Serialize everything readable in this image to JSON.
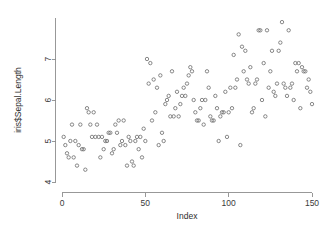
{
  "chart_data": {
    "type": "scatter",
    "title": "",
    "xlabel": "Index",
    "ylabel": "iris$Sepal.Length",
    "xlim": [
      0,
      150
    ],
    "ylim": [
      4.0,
      8.0
    ],
    "xticks": [
      "0",
      "50",
      "100",
      "150"
    ],
    "xtick_values": [
      0,
      50,
      100,
      150
    ],
    "yticks": [
      "4",
      "5",
      "6",
      "7"
    ],
    "ytick_values": [
      4,
      5,
      6,
      7
    ],
    "grid": false,
    "legend": "none",
    "marker": "open-circle",
    "marker_color": "#6b6b6b",
    "series": [
      {
        "name": "iris$Sepal.Length",
        "x": [
          1,
          2,
          3,
          4,
          5,
          6,
          7,
          8,
          9,
          10,
          11,
          12,
          13,
          14,
          15,
          16,
          17,
          18,
          19,
          20,
          21,
          22,
          23,
          24,
          25,
          26,
          27,
          28,
          29,
          30,
          31,
          32,
          33,
          34,
          35,
          36,
          37,
          38,
          39,
          40,
          41,
          42,
          43,
          44,
          45,
          46,
          47,
          48,
          49,
          50,
          51,
          52,
          53,
          54,
          55,
          56,
          57,
          58,
          59,
          60,
          61,
          62,
          63,
          64,
          65,
          66,
          67,
          68,
          69,
          70,
          71,
          72,
          73,
          74,
          75,
          76,
          77,
          78,
          79,
          80,
          81,
          82,
          83,
          84,
          85,
          86,
          87,
          88,
          89,
          90,
          91,
          92,
          93,
          94,
          95,
          96,
          97,
          98,
          99,
          100,
          101,
          102,
          103,
          104,
          105,
          106,
          107,
          108,
          109,
          110,
          111,
          112,
          113,
          114,
          115,
          116,
          117,
          118,
          119,
          120,
          121,
          122,
          123,
          124,
          125,
          126,
          127,
          128,
          129,
          130,
          131,
          132,
          133,
          134,
          135,
          136,
          137,
          138,
          139,
          140,
          141,
          142,
          143,
          144,
          145,
          146,
          147,
          148,
          149,
          150
        ],
        "values": [
          5.1,
          4.9,
          4.7,
          4.6,
          5.0,
          5.4,
          4.6,
          5.0,
          4.4,
          4.9,
          5.4,
          4.8,
          4.8,
          4.3,
          5.8,
          5.7,
          5.4,
          5.1,
          5.7,
          5.1,
          5.4,
          5.1,
          4.6,
          5.1,
          4.8,
          5.0,
          5.0,
          5.2,
          5.2,
          4.7,
          4.8,
          5.4,
          5.2,
          5.5,
          4.9,
          5.0,
          5.5,
          4.9,
          4.4,
          5.1,
          5.0,
          4.5,
          4.4,
          5.0,
          5.1,
          4.8,
          5.1,
          4.6,
          5.3,
          5.0,
          7.0,
          6.4,
          6.9,
          5.5,
          6.5,
          5.7,
          6.3,
          4.9,
          6.6,
          5.2,
          5.0,
          5.9,
          6.0,
          6.1,
          5.6,
          6.7,
          5.6,
          5.8,
          6.2,
          5.6,
          5.9,
          6.1,
          6.3,
          6.1,
          6.4,
          6.6,
          6.8,
          6.7,
          6.0,
          5.7,
          5.5,
          5.5,
          5.8,
          6.0,
          5.4,
          6.0,
          6.7,
          6.3,
          5.6,
          5.5,
          5.5,
          6.1,
          5.8,
          5.0,
          5.6,
          5.7,
          5.7,
          6.2,
          5.1,
          5.7,
          6.3,
          5.8,
          7.1,
          6.3,
          6.5,
          7.6,
          4.9,
          7.3,
          6.7,
          7.2,
          6.5,
          6.4,
          6.8,
          5.7,
          5.8,
          6.4,
          6.5,
          7.7,
          7.7,
          6.0,
          6.9,
          5.6,
          7.7,
          6.3,
          6.7,
          7.2,
          6.2,
          6.1,
          6.4,
          7.2,
          7.4,
          7.9,
          6.4,
          6.3,
          6.1,
          7.7,
          6.3,
          6.4,
          6.0,
          6.9,
          6.7,
          6.9,
          5.8,
          6.8,
          6.7,
          6.7,
          6.3,
          6.5,
          6.2,
          5.9
        ]
      }
    ]
  },
  "plot": {
    "x_axis_title": "Index",
    "y_axis_title": "iris$Sepal.Length"
  }
}
